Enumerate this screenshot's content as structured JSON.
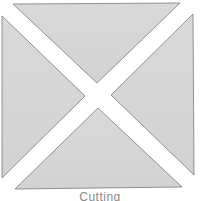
{
  "diagram": {
    "caption": "Cutting",
    "fill_color": "#d6d6d6",
    "stroke_color": "#7a7a7a",
    "pieces": [
      {
        "name": "top-triangle",
        "points": "13,4 180,3 97,83"
      },
      {
        "name": "right-triangle",
        "points": "193,14 194,175 111,95"
      },
      {
        "name": "bottom-triangle",
        "points": "15,189 182,187 98,108"
      },
      {
        "name": "left-triangle",
        "points": "2,16 2,178 85,96"
      }
    ]
  }
}
